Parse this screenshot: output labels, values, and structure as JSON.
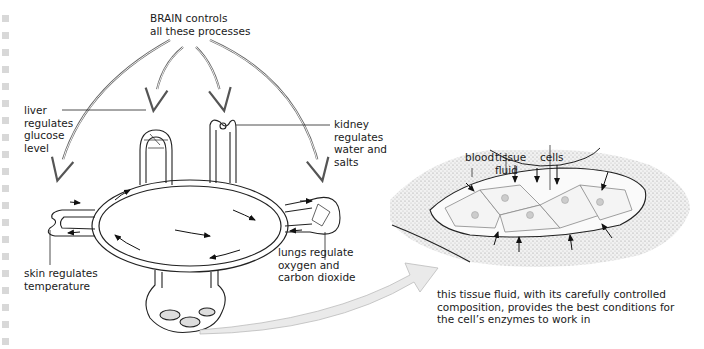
{
  "gutter": {
    "marker_count": 20,
    "marker_color": "#d8d8d8"
  },
  "left_diagram": {
    "brain_label": "BRAIN controls\nall these processes",
    "liver_label": "liver\nregulates\nglucose\nlevel",
    "kidney_label": "kidney\nregulates\nwater and\nsalts",
    "skin_label": "skin regulates\ntemperature",
    "lungs_label": "lungs regulate\noxygen and\ncarbon dioxide"
  },
  "right_diagram": {
    "blood_label": "blood",
    "tissue_fluid_label": "tissue\nfluid",
    "cells_label": "cells",
    "caption": "this tissue fluid, with its carefully controlled\ncomposition, provides the best conditions for\nthe cell’s enzymes to work in"
  }
}
